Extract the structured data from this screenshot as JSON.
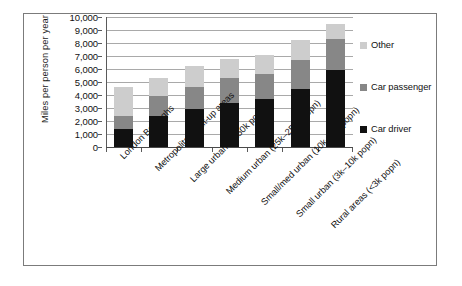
{
  "chart_data": {
    "type": "bar",
    "subtype": "stacked-bar",
    "title": "",
    "xlabel": "",
    "ylabel": "Miles per person per year",
    "ylim": [
      0,
      10000
    ],
    "ytick_labels": [
      "10,000",
      "9,000",
      "8,000",
      "7,000",
      "6,000",
      "5,000",
      "4,000",
      "3,000",
      "2,000",
      "1,000",
      "0"
    ],
    "ytick_values": [
      10000,
      9000,
      8000,
      7000,
      6000,
      5000,
      4000,
      3000,
      2000,
      1000,
      0
    ],
    "grid": true,
    "legend_position": "right",
    "categories": [
      "London Boroughs",
      "Metropolitan built-up areas",
      "Large urban (>250k popn)",
      "Medium urban (25k–250k popn)",
      "Small/med urban (10k–25k popn)",
      "Small urban (3k–10k popn)",
      "Rural areas (<3k popn)"
    ],
    "series": [
      {
        "name": "Car driver",
        "color": "#111111",
        "values": [
          1400,
          2400,
          2950,
          3350,
          3700,
          4450,
          5900
        ]
      },
      {
        "name": "Car passenger",
        "color": "#878787",
        "values": [
          1000,
          1500,
          1700,
          1950,
          1950,
          2250,
          2400
        ]
      },
      {
        "name": "Other",
        "color": "#cdcdcd",
        "values": [
          2200,
          1400,
          1550,
          1450,
          1450,
          1500,
          1150
        ]
      }
    ],
    "totals": [
      4600,
      5300,
      6200,
      6750,
      7100,
      8200,
      9450
    ],
    "legend_order": [
      "Other",
      "Car passenger",
      "Car driver"
    ]
  }
}
